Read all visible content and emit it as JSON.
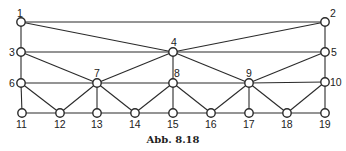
{
  "diagram": {
    "caption": "Abb. 8.18",
    "nodes": [
      {
        "id": "1",
        "x": 21,
        "y": 22,
        "label_dx": -4,
        "label_dy": -5
      },
      {
        "id": "2",
        "x": 325,
        "y": 22,
        "label_dx": 5,
        "label_dy": -5
      },
      {
        "id": "3",
        "x": 21,
        "y": 52,
        "label_dx": -12,
        "label_dy": 4
      },
      {
        "id": "4",
        "x": 173,
        "y": 52,
        "label_dx": -2,
        "label_dy": -6
      },
      {
        "id": "5",
        "x": 325,
        "y": 52,
        "label_dx": 6,
        "label_dy": 4
      },
      {
        "id": "6",
        "x": 21,
        "y": 83,
        "label_dx": -12,
        "label_dy": 4
      },
      {
        "id": "7",
        "x": 97,
        "y": 83,
        "label_dx": -3,
        "label_dy": -6
      },
      {
        "id": "8",
        "x": 173,
        "y": 83,
        "label_dx": 1,
        "label_dy": -6
      },
      {
        "id": "9",
        "x": 249,
        "y": 83,
        "label_dx": -3,
        "label_dy": -6
      },
      {
        "id": "10",
        "x": 325,
        "y": 82,
        "label_dx": 5,
        "label_dy": 4
      },
      {
        "id": "11",
        "x": 22,
        "y": 113,
        "label_dx": -6,
        "label_dy": 15
      },
      {
        "id": "12",
        "x": 60,
        "y": 113,
        "label_dx": -6,
        "label_dy": 15
      },
      {
        "id": "13",
        "x": 97,
        "y": 113,
        "label_dx": -6,
        "label_dy": 15
      },
      {
        "id": "14",
        "x": 135,
        "y": 113,
        "label_dx": -6,
        "label_dy": 15
      },
      {
        "id": "15",
        "x": 173,
        "y": 113,
        "label_dx": -6,
        "label_dy": 15
      },
      {
        "id": "16",
        "x": 211,
        "y": 113,
        "label_dx": -6,
        "label_dy": 15
      },
      {
        "id": "17",
        "x": 249,
        "y": 113,
        "label_dx": -6,
        "label_dy": 15
      },
      {
        "id": "18",
        "x": 287,
        "y": 113,
        "label_dx": -6,
        "label_dy": 15
      },
      {
        "id": "19",
        "x": 325,
        "y": 113,
        "label_dx": -6,
        "label_dy": 15
      }
    ],
    "edges": [
      [
        "1",
        "2"
      ],
      [
        "1",
        "4"
      ],
      [
        "2",
        "4"
      ],
      [
        "1",
        "3"
      ],
      [
        "2",
        "5"
      ],
      [
        "3",
        "4"
      ],
      [
        "4",
        "5"
      ],
      [
        "3",
        "7"
      ],
      [
        "4",
        "7"
      ],
      [
        "4",
        "8"
      ],
      [
        "4",
        "9"
      ],
      [
        "5",
        "9"
      ],
      [
        "3",
        "6"
      ],
      [
        "5",
        "10"
      ],
      [
        "6",
        "7"
      ],
      [
        "7",
        "8"
      ],
      [
        "8",
        "9"
      ],
      [
        "9",
        "10"
      ],
      [
        "6",
        "11"
      ],
      [
        "6",
        "12"
      ],
      [
        "7",
        "12"
      ],
      [
        "7",
        "13"
      ],
      [
        "7",
        "14"
      ],
      [
        "8",
        "14"
      ],
      [
        "8",
        "15"
      ],
      [
        "8",
        "16"
      ],
      [
        "9",
        "16"
      ],
      [
        "9",
        "17"
      ],
      [
        "9",
        "18"
      ],
      [
        "10",
        "18"
      ],
      [
        "10",
        "19"
      ],
      [
        "11",
        "12"
      ],
      [
        "12",
        "13"
      ],
      [
        "13",
        "14"
      ],
      [
        "14",
        "15"
      ],
      [
        "15",
        "16"
      ],
      [
        "16",
        "17"
      ],
      [
        "17",
        "18"
      ],
      [
        "18",
        "19"
      ]
    ]
  }
}
